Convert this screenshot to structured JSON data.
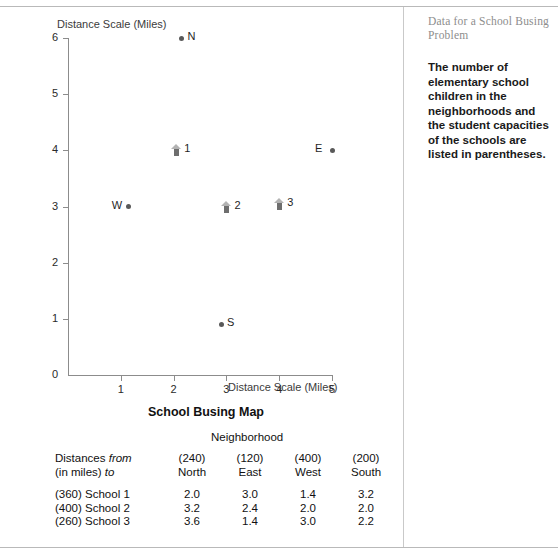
{
  "page": {
    "side_title": "Data for a School Busing Problem",
    "side_body": "The number of elementary school children in the neighborhoods and the student capacities of the schools are listed in parentheses."
  },
  "chart_data": {
    "type": "scatter",
    "title": "School Busing Map",
    "xlabel": "Distance Scale (Miles)",
    "ylabel": "Distance Scale (Miles)",
    "xlim": [
      0,
      5
    ],
    "ylim": [
      0,
      6
    ],
    "xticks": [
      "0",
      "1",
      "2",
      "3",
      "4",
      "5"
    ],
    "yticks": [
      "0",
      "1",
      "2",
      "3",
      "4",
      "5",
      "6"
    ],
    "grid": false,
    "legend": "none",
    "series": [
      {
        "name": "Neighborhoods",
        "marker": "dot",
        "points": [
          {
            "label": "N",
            "x": 2.15,
            "y": 6.0,
            "label_side": "right"
          },
          {
            "label": "E",
            "x": 5.0,
            "y": 4.0,
            "label_side": "left"
          },
          {
            "label": "W",
            "x": 1.15,
            "y": 3.0,
            "label_side": "left"
          },
          {
            "label": "S",
            "x": 2.9,
            "y": 0.9,
            "label_side": "right"
          }
        ]
      },
      {
        "name": "Schools",
        "marker": "school-house",
        "points": [
          {
            "label": "1",
            "x": 2.05,
            "y": 4.0,
            "label_side": "right"
          },
          {
            "label": "2",
            "x": 3.0,
            "y": 3.0,
            "label_side": "right"
          },
          {
            "label": "3",
            "x": 4.0,
            "y": 3.05,
            "label_side": "right"
          }
        ]
      }
    ]
  },
  "table": {
    "title": "School Busing Map",
    "group_header": "Neighborhood",
    "row_header_line1_pre": "Distances ",
    "row_header_line1_em": "from",
    "row_header_line2_pre": "(in miles) ",
    "row_header_line2_em": "to",
    "columns": [
      {
        "capacity": "(240)",
        "name": "North"
      },
      {
        "capacity": "(120)",
        "name": "East"
      },
      {
        "capacity": "(400)",
        "name": "West"
      },
      {
        "capacity": "(200)",
        "name": "South"
      }
    ],
    "rows": [
      {
        "label": "(360) School 1",
        "values": [
          "2.0",
          "3.0",
          "1.4",
          "3.2"
        ]
      },
      {
        "label": "(400) School 2",
        "values": [
          "3.2",
          "2.4",
          "2.0",
          "2.0"
        ]
      },
      {
        "label": "(260) School 3",
        "values": [
          "3.6",
          "1.4",
          "3.0",
          "2.2"
        ]
      }
    ]
  }
}
